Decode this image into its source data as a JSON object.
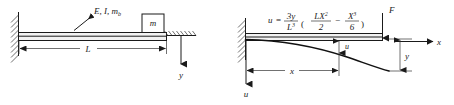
{
  "figure": {
    "panels": [
      {
        "id": "left",
        "name": "cantilever-with-tip-mass",
        "labels": {
          "beam_props": "E, I, m",
          "beam_props_sub": "b",
          "tip_mass": "m",
          "span": "L",
          "displacement_axis": "y"
        }
      },
      {
        "id": "right",
        "name": "cantilever-deflection-shape",
        "labels": {
          "tip_force": "F",
          "axis_x": "x",
          "axis_u": "u",
          "tip_deflection": "y",
          "local_deflection": "u",
          "coordinate": "x"
        },
        "equation": {
          "lhs": "u",
          "equals": "=",
          "coef_num": "3y",
          "coef_den": "L",
          "coef_den_exp": "3",
          "open_paren": "(",
          "t1_num": "LX",
          "t1_num_exp": "2",
          "t1_den": "2",
          "minus": "−",
          "t2_num": "X",
          "t2_num_exp": "3",
          "t2_den": "6",
          "close_paren": ")"
        }
      }
    ]
  },
  "colors": {
    "ink": "#1a1a1a",
    "beam_fill": "#f2f2f2",
    "background": "#ffffff"
  }
}
